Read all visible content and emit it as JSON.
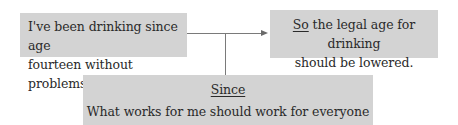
{
  "diagram": {
    "type": "argument-map",
    "reason": {
      "lines": [
        "I've been drinking since age",
        "fourteen without problems."
      ]
    },
    "claim": {
      "connective": "So",
      "lines_rest": [
        "the legal age for drinking",
        "should be lowered."
      ]
    },
    "warrant": {
      "connective": "Since",
      "text": "What works for me should work for everyone else."
    },
    "colors": {
      "box_fill": "#d3d3d3",
      "line": "#7a7a7a",
      "text": "#2a2a2a"
    }
  }
}
